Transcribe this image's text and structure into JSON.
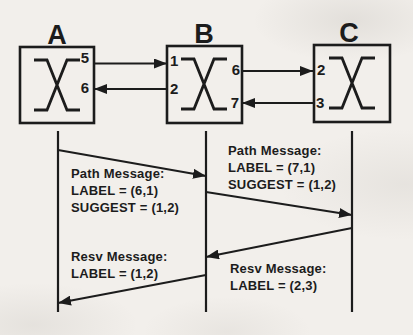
{
  "colors": {
    "paper": "#f2efeb",
    "ink": "#1c1c1c"
  },
  "nodes": {
    "a": {
      "label": "A",
      "port_right_top": "5",
      "port_right_bottom": "6"
    },
    "b": {
      "label": "B",
      "port_left_top": "1",
      "port_left_bottom": "2",
      "port_right_top": "6",
      "port_right_bottom": "7"
    },
    "c": {
      "label": "C",
      "port_left_top": "2",
      "port_left_bottom": "3"
    }
  },
  "links": [
    {
      "from": "A",
      "from_port": "5",
      "to": "B",
      "to_port": "1",
      "direction": "right"
    },
    {
      "from": "B",
      "from_port": "2",
      "to": "A",
      "to_port": "6",
      "direction": "left"
    },
    {
      "from": "B",
      "from_port": "6",
      "to": "C",
      "to_port": "2",
      "direction": "right"
    },
    {
      "from": "C",
      "from_port": "3",
      "to": "B",
      "to_port": "7",
      "direction": "left"
    }
  ],
  "messages": {
    "path_ab": {
      "from": "A",
      "to": "B",
      "lines": [
        "Path Message:",
        "LABEL = (6,1)",
        "SUGGEST = (1,2)"
      ]
    },
    "path_bc": {
      "from": "B",
      "to": "C",
      "lines": [
        "Path Message:",
        "LABEL = (7,1)",
        "SUGGEST = (1,2)"
      ]
    },
    "resv_cb": {
      "from": "C",
      "to": "B",
      "lines": [
        "Resv Message:",
        "LABEL = (2,3)"
      ]
    },
    "resv_ba": {
      "from": "B",
      "to": "A",
      "lines": [
        "Resv Message:",
        "LABEL = (1,2)"
      ]
    }
  }
}
